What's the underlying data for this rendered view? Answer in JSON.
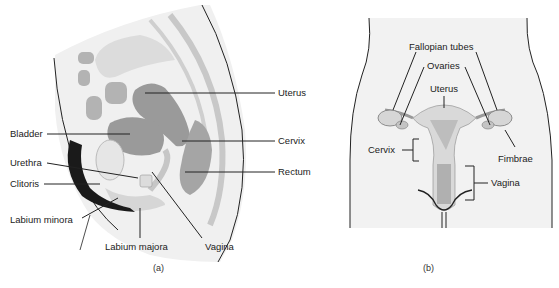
{
  "panel_a": {
    "caption": "(a)",
    "labels": {
      "uterus": "Uterus",
      "bladder": "Bladder",
      "cervix": "Cervix",
      "urethra": "Urethra",
      "rectum": "Rectum",
      "clitoris": "Clitoris",
      "labium_minora": "Labium minora",
      "labium_majora": "Labium majora",
      "vagina": "Vagina"
    }
  },
  "panel_b": {
    "caption": "(b)",
    "labels": {
      "fallopian_tubes": "Fallopian tubes",
      "ovaries": "Ovaries",
      "uterus": "Uterus",
      "cervix": "Cervix",
      "fimbrae": "Fimbrae",
      "vagina": "Vagina"
    }
  },
  "colors": {
    "skin": "#f0f0f0",
    "organ_light": "#d6d6d6",
    "organ_mid": "#b3b3b3",
    "organ_dark": "#9a9a9a",
    "outline": "#222222",
    "hair": "#1a1a1a"
  }
}
